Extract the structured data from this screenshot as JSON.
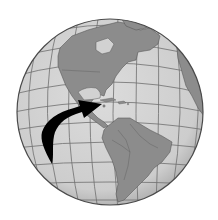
{
  "image": {
    "subject": "globe",
    "view": "Western Hemisphere — Americas centered",
    "highlight": "Caribbean",
    "pointer": "curved black arrow from the Pacific pointing toward the Caribbean Sea"
  },
  "colors": {
    "background": "#ffffff",
    "ocean": "#d2d2d2",
    "land": "#8c8c8c",
    "land_border": "#5a5a5a",
    "graticule": "#6e6e6e",
    "rim": "#4a4a4a",
    "arrow": "#000000"
  }
}
